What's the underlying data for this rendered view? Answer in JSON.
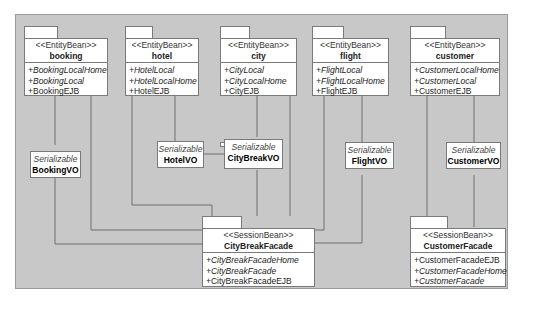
{
  "diagram": {
    "entity_beans": [
      {
        "stereotype": "<<EntityBean>>",
        "name": "booking",
        "ops": [
          {
            "label": "+BookingLocalHome",
            "italic": true
          },
          {
            "label": "+BookingLocal",
            "italic": true
          },
          {
            "label": "+BookingEJB",
            "italic": false
          }
        ]
      },
      {
        "stereotype": "<<EntityBean>>",
        "name": "hotel",
        "ops": [
          {
            "label": "+HotelLocal",
            "italic": true
          },
          {
            "label": "+HotelLocalHome",
            "italic": true
          },
          {
            "label": "+HotelEJB",
            "italic": false
          }
        ]
      },
      {
        "stereotype": "<<EntityBean>>",
        "name": "city",
        "ops": [
          {
            "label": "+CityLocal",
            "italic": true
          },
          {
            "label": "+CityLocalHome",
            "italic": true
          },
          {
            "label": "+CityEJB",
            "italic": false
          }
        ]
      },
      {
        "stereotype": "<<EntityBean>>",
        "name": "flight",
        "ops": [
          {
            "label": "+FlightLocal",
            "italic": true
          },
          {
            "label": "+FlightLocalHome",
            "italic": true
          },
          {
            "label": "+FlightEJB",
            "italic": false
          }
        ]
      },
      {
        "stereotype": "<<EntityBean>>",
        "name": "customer",
        "ops": [
          {
            "label": "+CustomerLocalHome",
            "italic": true
          },
          {
            "label": "+CustomerLocal",
            "italic": true
          },
          {
            "label": "+CustomerEJB",
            "italic": false
          }
        ]
      }
    ],
    "value_objects": [
      {
        "stereotype": "Serializable",
        "name": "BookingVO"
      },
      {
        "stereotype": "Serializable",
        "name": "HotelVO"
      },
      {
        "stereotype": "Serializable",
        "name": "CityBreakVO"
      },
      {
        "stereotype": "Serializable",
        "name": "FlightVO"
      },
      {
        "stereotype": "Serializable",
        "name": "CustomerVO"
      }
    ],
    "session_beans": [
      {
        "stereotype": "<<SessionBean>>",
        "name": "CityBreakFacade",
        "ops": [
          {
            "label": "+CityBreakFacadeHome",
            "italic": true
          },
          {
            "label": "+CityBreakFacade",
            "italic": true
          },
          {
            "label": "+CityBreakFacadeEJB",
            "italic": false
          }
        ]
      },
      {
        "stereotype": "<<SessionBean>>",
        "name": "CustomerFacade",
        "ops": [
          {
            "label": "+CustomerFacadeEJB",
            "italic": false
          },
          {
            "label": "+CustomerFacadeHome",
            "italic": true
          },
          {
            "label": "+CustomerFacade",
            "italic": true
          }
        ]
      }
    ]
  },
  "colors": {
    "background": "#c8c8c8",
    "box": "#ffffff",
    "line": "#6e6e6e"
  }
}
